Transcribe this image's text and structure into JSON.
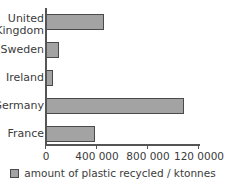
{
  "chart_data": {
    "type": "bar",
    "orientation": "horizontal",
    "title": "",
    "xlabel": "",
    "ylabel": "",
    "categories": [
      "United Kingdom",
      "Sweden",
      "Ireland",
      "Germany",
      "France"
    ],
    "values": [
      455000,
      102000,
      55000,
      1082000,
      384000
    ],
    "series": [
      {
        "name": "amount of plastic recycled / ktonnes",
        "values": [
          455000,
          102000,
          55000,
          1082000,
          384000
        ]
      }
    ],
    "xlim": [
      0,
      1400000
    ],
    "ylim": null,
    "xticks": [
      0,
      400000,
      800000,
      1200000
    ],
    "xticklabels": [
      "0",
      "400 000",
      "800 000",
      "120 0000"
    ],
    "grid": false,
    "legend": {
      "position": "bottom-center",
      "entries": [
        {
          "label": "amount of plastic recycled / ktonnes",
          "color": "#a3a3a3"
        }
      ]
    },
    "colors": {
      "bar_fill": "#a3a3a3",
      "bar_edge": "#4a4a4a",
      "axis": "#555555",
      "text": "#3b3b3b",
      "background": "#ffffff"
    },
    "category_label_lines": [
      [
        "United",
        "Kingdom"
      ],
      [
        "Sweden"
      ],
      [
        "Ireland"
      ],
      [
        "Germany"
      ],
      [
        "France"
      ]
    ]
  },
  "axis": {
    "ticks": [
      {
        "label": "0"
      },
      {
        "label": "400 000"
      },
      {
        "label": "800 000"
      },
      {
        "label": "120 0000"
      }
    ]
  },
  "bars": [
    {
      "category": "United Kingdom",
      "label": "United\nKingdom",
      "value": 455000
    },
    {
      "category": "Sweden",
      "label": "Sweden",
      "value": 102000
    },
    {
      "category": "Ireland",
      "label": "Ireland",
      "value": 55000
    },
    {
      "category": "Germany",
      "label": "Germany",
      "value": 1082000
    },
    {
      "category": "France",
      "label": "France",
      "value": 384000
    }
  ],
  "legend": {
    "label": "amount of plastic recycled / ktonnes"
  }
}
